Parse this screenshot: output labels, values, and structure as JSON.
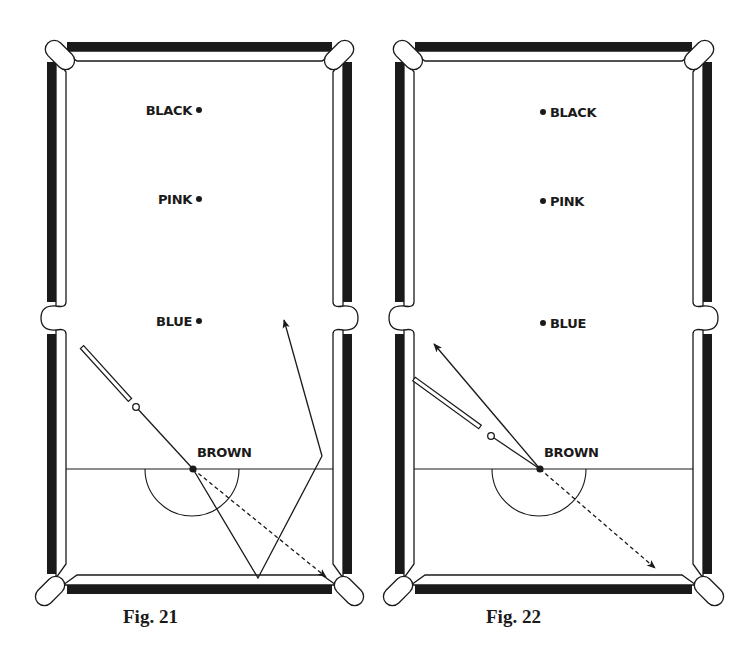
{
  "figures": [
    {
      "id": "fig21",
      "caption": "Fig. 21",
      "caption_pos": [
        123,
        608
      ],
      "table": {
        "x": 47,
        "y": 42,
        "w": 305,
        "h": 552
      },
      "baulk_y": 469,
      "d_center": [
        192,
        469
      ],
      "d_radius": 47,
      "balls": [
        {
          "name": "BLACK",
          "x": 199,
          "y": 110,
          "label_side": "left"
        },
        {
          "name": "PINK",
          "x": 199,
          "y": 199,
          "label_side": "left"
        },
        {
          "name": "BLUE",
          "x": 199,
          "y": 321,
          "label_side": "left"
        },
        {
          "name": "BROWN",
          "x": 193,
          "y": 469,
          "label_side": "above-right"
        }
      ],
      "cue": {
        "butt": [
          82,
          347
        ],
        "tip": [
          130,
          400
        ]
      },
      "cue_ball": [
        136,
        407
      ],
      "lines": [
        {
          "type": "solid",
          "points": [
            [
              136,
              407
            ],
            [
              193,
              469
            ]
          ]
        },
        {
          "type": "dashed-arrow",
          "points": [
            [
              193,
              469
            ],
            [
              326,
              577
            ]
          ]
        },
        {
          "type": "solid",
          "points": [
            [
              193,
              469
            ],
            [
              258,
              578
            ],
            [
              322,
              456
            ]
          ]
        },
        {
          "type": "arrow",
          "points": [
            [
              322,
              456
            ],
            [
              284,
              320
            ]
          ]
        }
      ]
    },
    {
      "id": "fig22",
      "caption": "Fig. 22",
      "caption_pos": [
        486,
        608
      ],
      "table": {
        "x": 395,
        "y": 42,
        "w": 317,
        "h": 552
      },
      "baulk_y": 469,
      "d_center": [
        539,
        469
      ],
      "d_radius": 47,
      "balls": [
        {
          "name": "BLACK",
          "x": 543,
          "y": 112,
          "label_side": "right"
        },
        {
          "name": "PINK",
          "x": 543,
          "y": 201,
          "label_side": "right"
        },
        {
          "name": "BLUE",
          "x": 543,
          "y": 323,
          "label_side": "right"
        },
        {
          "name": "BROWN",
          "x": 540,
          "y": 469,
          "label_side": "above-right"
        }
      ],
      "cue": {
        "butt": [
          414,
          379
        ],
        "tip": [
          480,
          427
        ]
      },
      "cue_ball": [
        491,
        436
      ],
      "lines": [
        {
          "type": "solid",
          "points": [
            [
              491,
              436
            ],
            [
              540,
              469
            ]
          ]
        },
        {
          "type": "arrow",
          "points": [
            [
              540,
              469
            ],
            [
              434,
              344
            ]
          ]
        },
        {
          "type": "dashed-arrow",
          "points": [
            [
              540,
              469
            ],
            [
              655,
              568
            ]
          ]
        }
      ]
    }
  ],
  "colors": {
    "ink": "#1a1a1a",
    "paper": "#ffffff"
  }
}
